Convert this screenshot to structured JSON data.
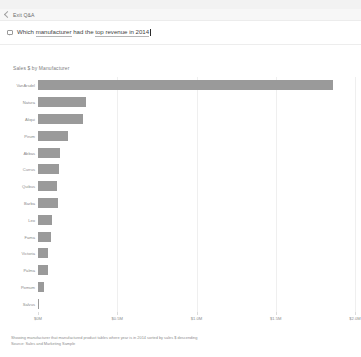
{
  "header": {
    "exit_label": "Exit Q&A",
    "back_icon": "chevron-left-icon"
  },
  "question": {
    "icon": "speech-bubble-icon",
    "prefix": "Which ",
    "term1": "manufacturer",
    "middle": " had the ",
    "term2": "top revenue in 2014",
    "value": "Which manufacturer had the top revenue in 2014",
    "placeholder": "Ask a question about your data"
  },
  "chart_data": {
    "type": "bar",
    "orientation": "horizontal",
    "title": "Sales $ by Manufacturer",
    "xlabel": "",
    "ylabel": "",
    "grid": true,
    "legend": "none",
    "xlim": [
      0,
      2000000
    ],
    "xticks": [
      0,
      500000,
      1000000,
      1500000,
      2000000
    ],
    "xticklabels": [
      "$0M",
      "$0.5M",
      "$1.0M",
      "$1.5M",
      "$2.0M"
    ],
    "categories": [
      "VanArsdel",
      "Natura",
      "Aliqui",
      "Pirum",
      "Abbas",
      "Currus",
      "Quibus",
      "Barba",
      "Leo",
      "Fama",
      "Victoria",
      "Palma",
      "Pomum",
      "Salvus"
    ],
    "values": [
      1862000,
      302000,
      286000,
      190000,
      138000,
      132000,
      122000,
      128000,
      86000,
      82000,
      62000,
      60000,
      38000,
      6000
    ]
  },
  "footer": {
    "line1": "Showing manufacturer that manufactured product tables where year is in 2014 sorted by sales $ descending",
    "line2": "Source: Sales and Marketing Sample"
  },
  "colors": {
    "bar": "#9a9a9a",
    "grid": "#efefef",
    "text_muted": "#8a8a8a"
  }
}
